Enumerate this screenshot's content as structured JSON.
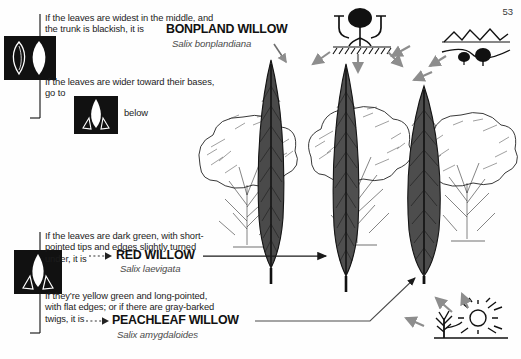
{
  "page": {
    "number": "53"
  },
  "key": {
    "couplets": [
      {
        "id": "bonpland",
        "lead_lines": [
          "If the leaves are widest in the middle, and",
          "the trunk is blackish, it is"
        ],
        "common_name": "BONPLAND WILLOW",
        "scientific_name": "Salix bonplandiana"
      },
      {
        "id": "go-to-below",
        "lead_lines": [
          "If the leaves are wider toward their bases,",
          "go to"
        ],
        "trailing_text": "below"
      },
      {
        "id": "red-willow",
        "lead_lines": [
          "If the leaves are dark green, with short-",
          "pointed tips and edges slightly turned",
          "under, it is"
        ],
        "common_name": "RED WILLOW",
        "scientific_name": "Salix laevigata"
      },
      {
        "id": "peachleaf-willow",
        "lead_lines": [
          "If they’re yellow green and long-pointed,",
          "with flat edges; or if there are gray-barked",
          "twigs, it is"
        ],
        "common_name": "PEACHLEAF WILLOW",
        "scientific_name": "Salix amygdaloides"
      }
    ]
  },
  "icons": {
    "leaf_pair": "two-leaf-shapes-icon",
    "narrow_leaf_a": "narrow-leaf-icon",
    "narrow_leaf_b": "narrow-leaf-icon",
    "habitat_soil": "tree-roots-in-soil-icon",
    "habitat_mountains": "mountains-and-river-icon",
    "habitat_sun": "sun-and-tree-icon"
  },
  "illustration": {
    "leaves": [
      {
        "id": "leaf-left",
        "label": "bonpland-willow-leaf"
      },
      {
        "id": "leaf-middle",
        "label": "red-willow-leaf"
      },
      {
        "id": "leaf-right",
        "label": "peachleaf-willow-leaf"
      }
    ],
    "trees": [
      {
        "id": "tree-left",
        "label": "willow-tree-sketch"
      },
      {
        "id": "tree-middle",
        "label": "willow-tree-sketch"
      },
      {
        "id": "tree-right",
        "label": "willow-tree-sketch"
      }
    ]
  },
  "colors": {
    "ink": "#1a1a1a",
    "leaf_fill": "#4f4f4f",
    "arrow_gray": "#8d8d8d",
    "icon_box": "#111111",
    "background": "#fefefe"
  }
}
